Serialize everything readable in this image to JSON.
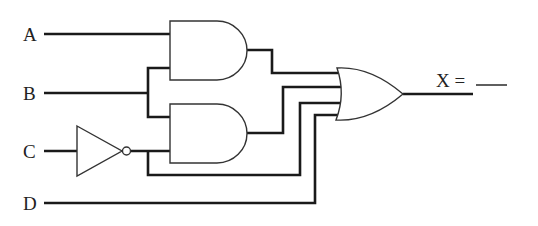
{
  "diagram": {
    "type": "logic-circuit",
    "inputs": [
      {
        "name": "A",
        "label": "A"
      },
      {
        "name": "B",
        "label": "B"
      },
      {
        "name": "C",
        "label": "C"
      },
      {
        "name": "D",
        "label": "D"
      }
    ],
    "gates": [
      {
        "id": "and1",
        "type": "AND",
        "inputs": [
          "A",
          "B"
        ]
      },
      {
        "id": "not1",
        "type": "NOT",
        "inputs": [
          "C"
        ]
      },
      {
        "id": "and2",
        "type": "AND",
        "inputs": [
          "B",
          "NOT C"
        ]
      },
      {
        "id": "or1",
        "type": "OR",
        "inputs": [
          "and1",
          "and2",
          "NOT C",
          "D"
        ]
      }
    ],
    "output": {
      "label": "X =",
      "blank": "___"
    }
  }
}
